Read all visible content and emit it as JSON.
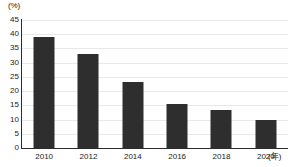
{
  "chart_data": {
    "type": "bar",
    "title": "",
    "subtitle": "",
    "xlabel": "(年)",
    "ylabel": "(%)",
    "categories": [
      "2010",
      "2012",
      "2014",
      "2016",
      "2018",
      "2020"
    ],
    "values": [
      39.0,
      33.2,
      23.2,
      15.3,
      13.5,
      9.7
    ],
    "series": [
      {
        "name": "",
        "values": [
          39.0,
          33.2,
          23.2,
          15.3,
          13.5,
          9.7
        ]
      }
    ],
    "ylim": [
      0,
      45
    ],
    "xlim": [
      0,
      6
    ],
    "y_ticks": [
      0,
      5,
      10,
      15,
      20,
      25,
      30,
      35,
      40,
      45
    ],
    "y_tick_labels": [
      "0",
      "5",
      "10",
      "15",
      "20",
      "25",
      "30",
      "35",
      "40",
      "45"
    ],
    "x_tick_labels": [
      "2010",
      "2012",
      "2014",
      "2016",
      "2018",
      "2020"
    ],
    "grid": "horizontal",
    "legend": "none",
    "annotations": [],
    "colors": {
      "bar": "#2e2e2e",
      "gridline": "#e9e9e9",
      "axis": "#2b2b2b",
      "text": "#1a1a1a",
      "background": "#ffffff"
    }
  }
}
